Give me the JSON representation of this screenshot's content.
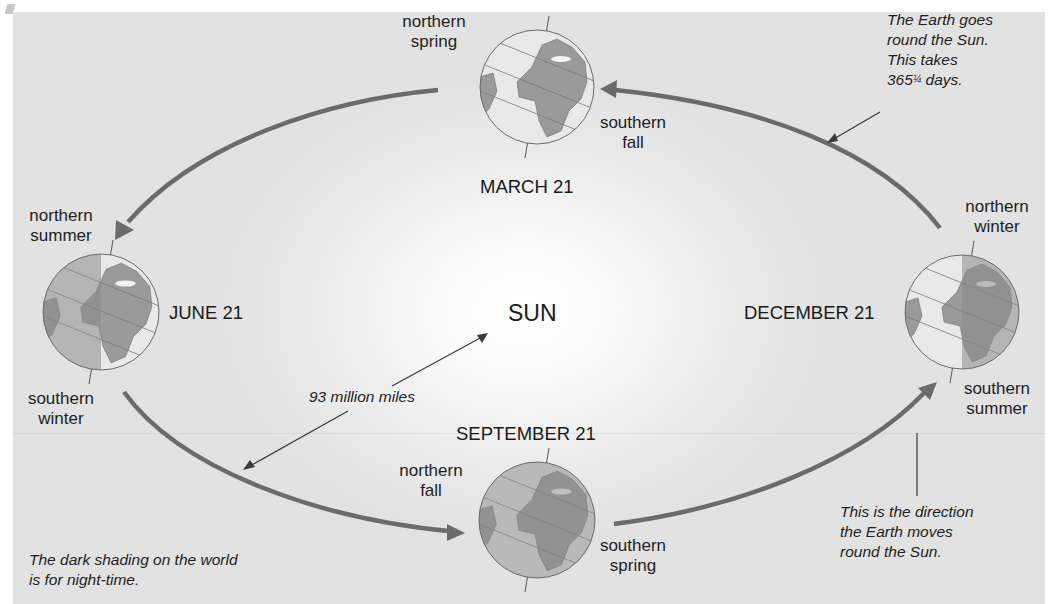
{
  "diagram": {
    "sun_label": "SUN",
    "positions": [
      {
        "id": "march",
        "date": "MARCH 21",
        "north": [
          "northern",
          "spring"
        ],
        "south": [
          "southern",
          "fall"
        ],
        "night_side": "none"
      },
      {
        "id": "june",
        "date": "JUNE 21",
        "north": [
          "northern",
          "summer"
        ],
        "south": [
          "southern",
          "winter"
        ],
        "night_side": "left"
      },
      {
        "id": "september",
        "date": "SEPTEMBER 21",
        "north": [
          "northern",
          "fall"
        ],
        "south": [
          "southern",
          "spring"
        ],
        "night_side": "full"
      },
      {
        "id": "december",
        "date": "DECEMBER 21",
        "north": [
          "northern",
          "winter"
        ],
        "south": [
          "southern",
          "summer"
        ],
        "night_side": "right"
      }
    ],
    "notes": {
      "orbit": [
        "The Earth goes",
        "round the Sun.",
        "This takes",
        "365",
        "¼",
        " days."
      ],
      "distance": "93 million miles",
      "direction": [
        "This is the direction",
        "the Earth moves",
        "round the Sun."
      ],
      "shading": [
        "The dark shading on the world",
        "is for night-time."
      ]
    },
    "colors": {
      "arrow": "#6b6b6b",
      "pointer": "#3a3a3a",
      "globe_day": "#e9e9e9",
      "globe_land_day": "#9a9a9a",
      "globe_night": "#8a8a8a",
      "globe_land_night": "#7a7a7a",
      "background": "#e2e2e2"
    }
  }
}
